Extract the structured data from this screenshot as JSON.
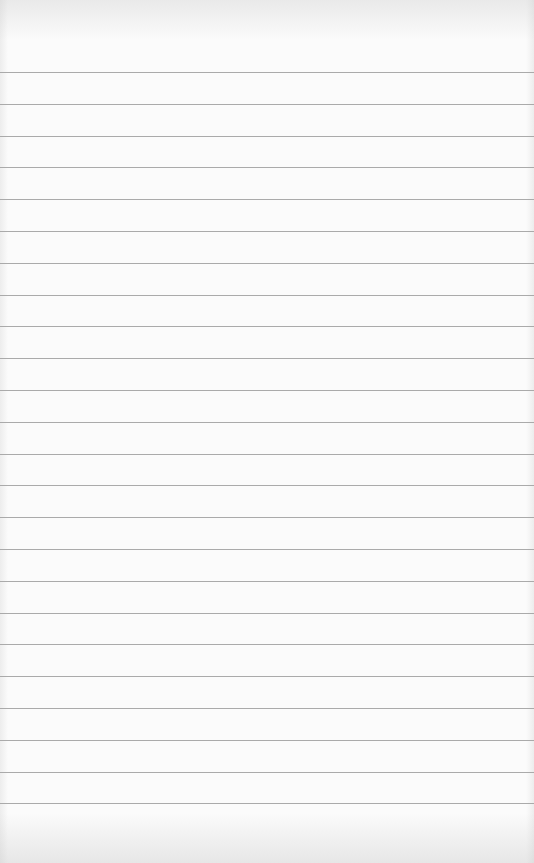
{
  "paper": {
    "background_color": "#fbfbfb",
    "line_color": "#aaaaaa",
    "first_line_y": 72,
    "line_spacing": 31.8,
    "line_count": 24
  }
}
